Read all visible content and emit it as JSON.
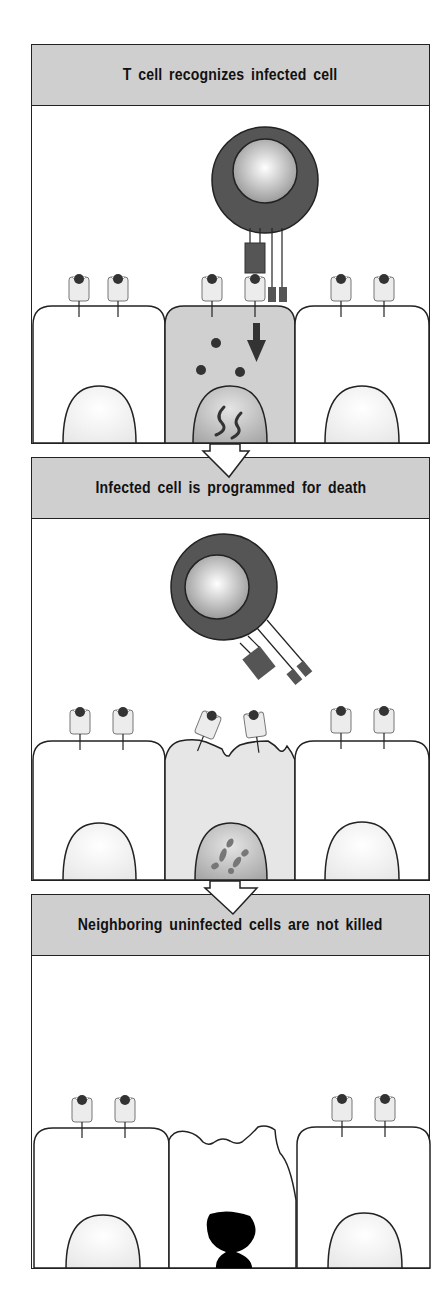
{
  "figure": {
    "panels": [
      {
        "id": "recognition",
        "title": "T cell recognizes infected cell",
        "t_cell": "attached",
        "infected_cell_state": "infected"
      },
      {
        "id": "programmed-death",
        "title": "Infected cell is programmed for death",
        "t_cell": "detaching",
        "infected_cell_state": "dying"
      },
      {
        "id": "neighbors-spared",
        "title": "Neighboring uninfected cells are not killed",
        "t_cell": "absent",
        "infected_cell_state": "apoptotic"
      }
    ],
    "colors": {
      "header_bg": "#cfcfcf",
      "tcell_outer": "#555555",
      "infected_cytoplasm": "#d0d0d0",
      "dying_cytoplasm": "#e6e6e6",
      "outline": "#222222"
    }
  }
}
